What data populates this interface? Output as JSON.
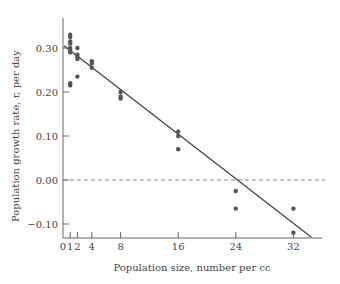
{
  "chart_data": {
    "type": "scatter",
    "title": "",
    "xlabel": "Population size, number per cc",
    "ylabel": "Population growth rate, r, per day",
    "xlim": [
      0,
      36
    ],
    "ylim": [
      -0.13,
      0.35
    ],
    "grid": false,
    "legend": null,
    "x_ticks": [
      0,
      1,
      2,
      4,
      8,
      16,
      24,
      32
    ],
    "x_tick_labels": [
      "0",
      "1",
      "2",
      "4",
      "8",
      "16",
      "24",
      "32"
    ],
    "y_ticks": [
      0.3,
      0.2,
      0.1,
      0.0,
      -0.1
    ],
    "y_tick_labels": [
      "0.30",
      "0.20",
      "0.10",
      "0.00",
      "−0.10"
    ],
    "points": [
      {
        "x": 1,
        "y": 0.33
      },
      {
        "x": 1,
        "y": 0.325
      },
      {
        "x": 1,
        "y": 0.315
      },
      {
        "x": 1,
        "y": 0.31
      },
      {
        "x": 1,
        "y": 0.3
      },
      {
        "x": 1,
        "y": 0.295
      },
      {
        "x": 1,
        "y": 0.29
      },
      {
        "x": 1,
        "y": 0.22
      },
      {
        "x": 1,
        "y": 0.215
      },
      {
        "x": 2,
        "y": 0.3
      },
      {
        "x": 2,
        "y": 0.285
      },
      {
        "x": 2,
        "y": 0.28
      },
      {
        "x": 2,
        "y": 0.275
      },
      {
        "x": 2,
        "y": 0.235
      },
      {
        "x": 4,
        "y": 0.27
      },
      {
        "x": 4,
        "y": 0.265
      },
      {
        "x": 4,
        "y": 0.255
      },
      {
        "x": 8,
        "y": 0.2
      },
      {
        "x": 8,
        "y": 0.19
      },
      {
        "x": 8,
        "y": 0.185
      },
      {
        "x": 16,
        "y": 0.11
      },
      {
        "x": 16,
        "y": 0.1
      },
      {
        "x": 16,
        "y": 0.07
      },
      {
        "x": 24,
        "y": -0.025
      },
      {
        "x": 24,
        "y": -0.065
      },
      {
        "x": 32,
        "y": -0.065
      },
      {
        "x": 32,
        "y": -0.12
      }
    ],
    "regression_line": {
      "x": [
        0,
        34.5
      ],
      "y": [
        0.305,
        -0.13
      ],
      "x_intercept": 24
    },
    "reference_line": {
      "y": 0.0,
      "style": "dashed"
    },
    "colors": {
      "points": "#555555",
      "line": "#444444",
      "axis": "#666666",
      "reference": "#888888"
    }
  }
}
